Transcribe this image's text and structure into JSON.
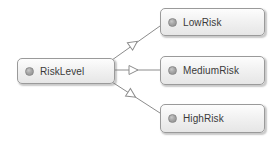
{
  "diagram": {
    "type": "uml-generalization",
    "background_color": "#ffffff",
    "edge_color": "#8c8c8c",
    "node_border_color": "#9a9a9a",
    "node_fill_color": "#f0f0f0",
    "label_color": "#3a3a3a",
    "icon_name": "class-node-icon",
    "superclass": {
      "id": "risklevel",
      "label": "RiskLevel"
    },
    "subclasses": [
      {
        "id": "lowrisk",
        "label": "LowRisk"
      },
      {
        "id": "mediumrisk",
        "label": "MediumRisk"
      },
      {
        "id": "highrisk",
        "label": "HighRisk"
      }
    ],
    "edges": [
      {
        "id": "edge-lowrisk",
        "from": "RiskLevel",
        "to": "LowRisk",
        "arrow": "hollow-triangle"
      },
      {
        "id": "edge-mediumrisk",
        "from": "RiskLevel",
        "to": "MediumRisk",
        "arrow": "hollow-triangle"
      },
      {
        "id": "edge-highrisk",
        "from": "RiskLevel",
        "to": "HighRisk",
        "arrow": "hollow-triangle"
      }
    ]
  }
}
